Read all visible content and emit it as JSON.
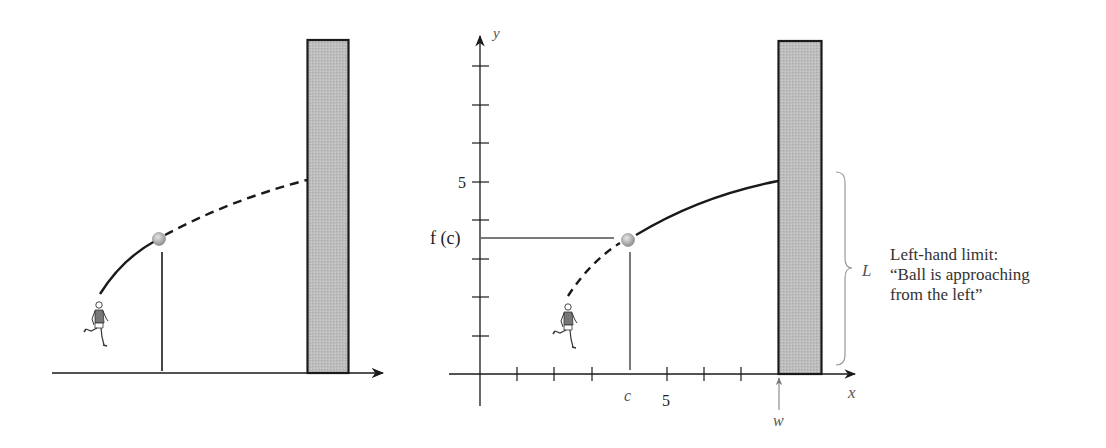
{
  "left_panel": {
    "description": "Ball thrown by runner toward wall, solid path up to ball then dashed path to wall"
  },
  "right_panel": {
    "axes": {
      "x_label": "x",
      "y_label": "y",
      "x_tick_label": "5",
      "y_tick_label": "5",
      "x_ticks_count": 8,
      "y_ticks_count": 8
    },
    "labels": {
      "c": "c",
      "f_of_c": "f (c)",
      "w": "w",
      "L": "L"
    }
  },
  "caption": {
    "line1": "Left-hand limit:",
    "line2": "“Ball is approaching",
    "line3": "from the left”"
  },
  "colors": {
    "wall_fill": "#b9b9b9",
    "wall_stroke": "#1a1a1a",
    "curve": "#1a1a1a",
    "guide_lines": "#7a7a7a",
    "ball": "#b0b0b0",
    "brace": "#999999"
  }
}
